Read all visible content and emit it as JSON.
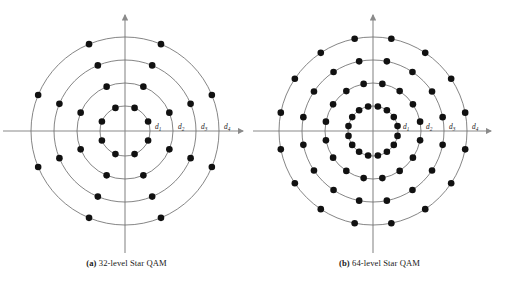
{
  "figure": {
    "title_present": false,
    "background_color": "#ffffff",
    "point_color": "#111111",
    "circle_color": "#6f6f6f",
    "axis_color": "#8a8a8a"
  },
  "panels": [
    {
      "id": "a",
      "caption_label": "(a)",
      "caption_text": "32-level Star QAM",
      "caption_full": "(a) 32-level Star QAM",
      "center": {
        "x": 125,
        "y": 131
      },
      "ring_count": 4,
      "points_per_ring": 8,
      "total_points": 32,
      "ring_radii": [
        25,
        48,
        71,
        94
      ],
      "angle_offset_deg": 22.5,
      "distance_labels": [
        {
          "text": "d",
          "sub": "1",
          "x": 155,
          "y": 129
        },
        {
          "text": "d",
          "sub": "2",
          "x": 178,
          "y": 129
        },
        {
          "text": "d",
          "sub": "3",
          "x": 201,
          "y": 129
        },
        {
          "text": "d",
          "sub": "4",
          "x": 224,
          "y": 129
        }
      ]
    },
    {
      "id": "b",
      "caption_label": "(b)",
      "caption_text": "64-level Star QAM",
      "caption_full": "(b) 64-level Star QAM",
      "center": {
        "x": 120,
        "y": 131
      },
      "ring_count": 4,
      "points_per_ring": 16,
      "total_points": 64,
      "ring_radii": [
        25,
        48,
        71,
        94
      ],
      "angle_offset_deg": 11.25,
      "distance_labels": [
        {
          "text": "d",
          "sub": "1",
          "x": 150,
          "y": 129
        },
        {
          "text": "d",
          "sub": "2",
          "x": 173,
          "y": 129
        },
        {
          "text": "d",
          "sub": "3",
          "x": 196,
          "y": 129
        },
        {
          "text": "d",
          "sub": "4",
          "x": 219,
          "y": 129
        }
      ]
    }
  ],
  "chart_data": {
    "type": "scatter",
    "subtitle": "",
    "xlabel": "",
    "ylabel": "",
    "grid": false,
    "legend": "none",
    "axes": "cartesian-arrows-through-origin",
    "annotations": [
      "d1",
      "d2",
      "d3",
      "d4"
    ],
    "charts": [
      {
        "name": "32-level Star QAM",
        "rings": [
          {
            "radius": 1,
            "label": "d1",
            "points": 8,
            "angles_deg": [
              22.5,
              67.5,
              112.5,
              157.5,
              202.5,
              247.5,
              292.5,
              337.5
            ]
          },
          {
            "radius": 2,
            "label": "d2",
            "points": 8,
            "angles_deg": [
              22.5,
              67.5,
              112.5,
              157.5,
              202.5,
              247.5,
              292.5,
              337.5
            ]
          },
          {
            "radius": 3,
            "label": "d3",
            "points": 8,
            "angles_deg": [
              22.5,
              67.5,
              112.5,
              157.5,
              202.5,
              247.5,
              292.5,
              337.5
            ]
          },
          {
            "radius": 4,
            "label": "d4",
            "points": 8,
            "angles_deg": [
              22.5,
              67.5,
              112.5,
              157.5,
              202.5,
              247.5,
              292.5,
              337.5
            ]
          }
        ],
        "total_points": 32
      },
      {
        "name": "64-level Star QAM",
        "rings": [
          {
            "radius": 1,
            "label": "d1",
            "points": 16,
            "angles_deg": [
              11.25,
              33.75,
              56.25,
              78.75,
              101.25,
              123.75,
              146.25,
              168.75,
              191.25,
              213.75,
              236.25,
              258.75,
              281.25,
              303.75,
              326.25,
              348.75
            ]
          },
          {
            "radius": 2,
            "label": "d2",
            "points": 16,
            "angles_deg": [
              11.25,
              33.75,
              56.25,
              78.75,
              101.25,
              123.75,
              146.25,
              168.75,
              191.25,
              213.75,
              236.25,
              258.75,
              281.25,
              303.75,
              326.25,
              348.75
            ]
          },
          {
            "radius": 3,
            "label": "d3",
            "points": 16,
            "angles_deg": [
              11.25,
              33.75,
              56.25,
              78.75,
              101.25,
              123.75,
              146.25,
              168.75,
              191.25,
              213.75,
              236.25,
              258.75,
              281.25,
              303.75,
              326.25,
              348.75
            ]
          },
          {
            "radius": 4,
            "label": "d4",
            "points": 16,
            "angles_deg": [
              11.25,
              33.75,
              56.25,
              78.75,
              101.25,
              123.75,
              146.25,
              168.75,
              191.25,
              213.75,
              236.25,
              258.75,
              281.25,
              303.75,
              326.25,
              348.75
            ]
          }
        ],
        "total_points": 64
      }
    ]
  }
}
